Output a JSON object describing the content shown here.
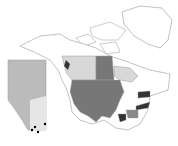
{
  "map": {
    "title": "",
    "inset": {
      "region": "Alberta",
      "shading": "elevation-grayscale",
      "points": [
        [
          35,
          127
        ],
        [
          32,
          130
        ],
        [
          38,
          132
        ],
        [
          45,
          124
        ]
      ]
    },
    "legend": [],
    "colors": {
      "land_outline": "#999999",
      "background": "#ffffff",
      "highlight_light": "#d8d8d8",
      "highlight_medium": "#777777",
      "highlight_dark": "#333333",
      "inset_fill": "#bbbbbb"
    },
    "shaded_regions": {
      "light": [
        "British Columbia (part)",
        "Alberta",
        "Saskatchewan",
        "Ontario (part)"
      ],
      "medium": [
        "Manitoba",
        "Contiguous USA (west and central)",
        "Georgia/Alabama"
      ],
      "dark": [
        "Pennsylvania",
        "North Carolina",
        "Louisiana",
        "Vancouver Island"
      ]
    }
  }
}
